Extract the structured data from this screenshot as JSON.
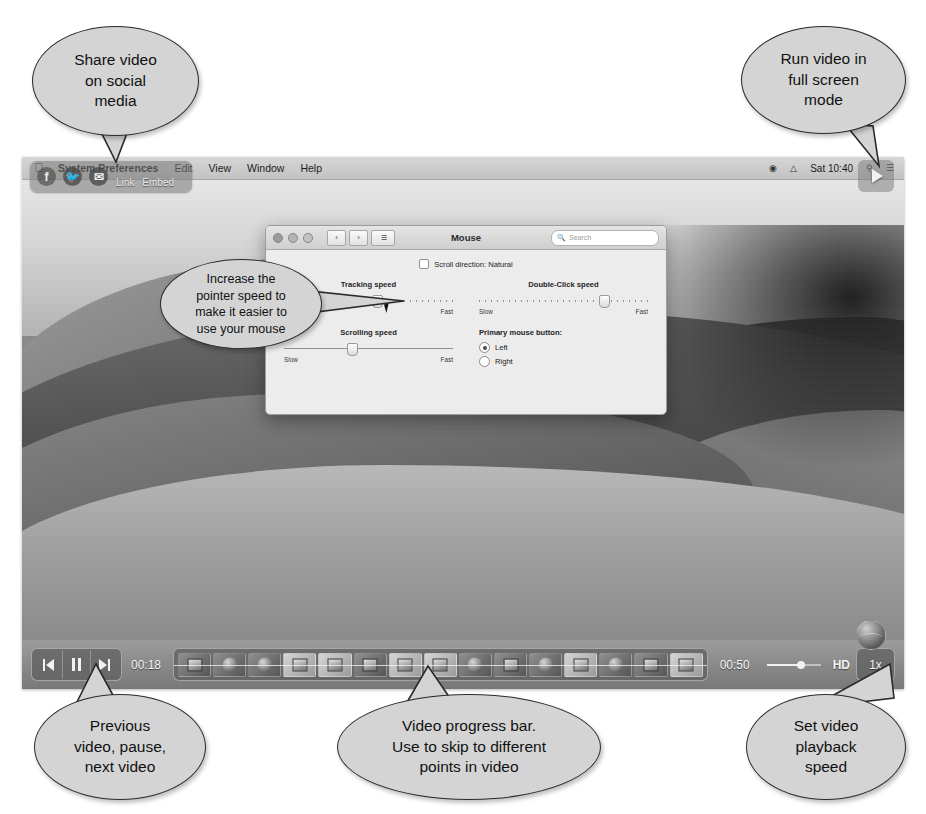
{
  "callouts": {
    "share": "Share video\non social\nmedia",
    "fullscreen": "Run video in\nfull screen\nmode",
    "pointer": "Increase the\npointer speed to\nmake it easier to\nuse your mouse",
    "transport": "Previous\nvideo, pause,\nnext video",
    "progress": "Video progress bar.\nUse to skip to different\npoints in video",
    "speed": "Set video\nplayback\nspeed"
  },
  "share_overlay": {
    "facebook_icon": "facebook-icon",
    "twitter_icon": "twitter-icon",
    "email_icon": "email-icon",
    "link_label": "Link",
    "embed_label": "Embed"
  },
  "fullscreen_button": {
    "icon": "fullscreen-play-icon"
  },
  "menubar": {
    "apple_icon": "apple-logo-icon",
    "items": [
      {
        "label": "System Preferences",
        "bold": true
      },
      {
        "label": "Edit",
        "bold": false
      },
      {
        "label": "View",
        "bold": false
      },
      {
        "label": "Window",
        "bold": false
      },
      {
        "label": "Help",
        "bold": false
      }
    ],
    "status": {
      "wifi_icon": "wifi-icon",
      "battery_icon": "battery-icon",
      "clock": "Sat 10:40",
      "search_icon": "spotlight-search-icon",
      "control_icon": "control-center-icon"
    }
  },
  "prefs_window": {
    "title": "Mouse",
    "traffic_lights": [
      "close",
      "minimize",
      "zoom"
    ],
    "nav": {
      "back": "‹",
      "forward": "›",
      "grid": "☰"
    },
    "search_placeholder": "Search",
    "scroll_direction": {
      "label": "Scroll direction: Natural",
      "checked": false
    },
    "sliders": [
      {
        "name": "Tracking speed",
        "min_label": "Slow",
        "max_label": "Fast",
        "value_pct": 52
      },
      {
        "name": "Scrolling speed",
        "min_label": "Slow",
        "max_label": "Fast",
        "value_pct": 37
      },
      {
        "name": "Double-Click speed",
        "min_label": "Slow",
        "max_label": "Fast",
        "value_pct": 71
      }
    ],
    "primary_button": {
      "title": "Primary mouse button:",
      "options": [
        {
          "label": "Left",
          "selected": true
        },
        {
          "label": "Right",
          "selected": false
        }
      ]
    },
    "footer": {
      "bluetooth_button": "Set Up Bluetooth Mouse...",
      "help_button": "?"
    }
  },
  "player": {
    "transport": {
      "previous": "previous-video-button",
      "pause": "pause-button",
      "next": "next-video-button"
    },
    "current_time": "00:18",
    "duration": "00:50",
    "quality_label": "HD",
    "speed_label": "1x",
    "volume_pct": 62,
    "thumbnail_count": 15
  }
}
